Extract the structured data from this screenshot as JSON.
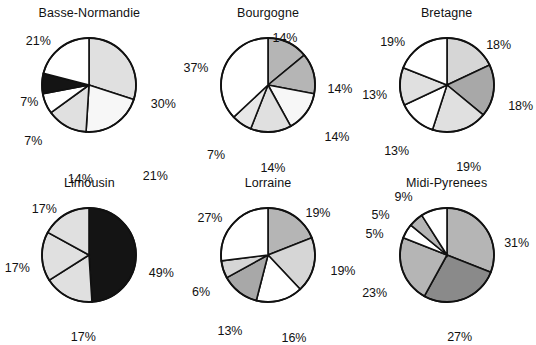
{
  "figure": {
    "background": "#ffffff",
    "rows": 2,
    "cols": 3,
    "label_suffix": "%"
  },
  "palette": {
    "white": "#ffffff",
    "very_light_gray": "#f2f2f2",
    "light_gray": "#e0e0e0",
    "light_gray2": "#d6d6d6",
    "medium_gray": "#b5b5b5",
    "medium_gray2": "#a8a8a8",
    "dark_gray": "#8a8a8a",
    "black": "#141414",
    "outline": "#111111"
  },
  "chart_data": [
    {
      "type": "pie",
      "title": "Basse-Normandie",
      "start_angle": 0,
      "direction": "clockwise",
      "categories": [
        "30%",
        "21%",
        "14%",
        "7%",
        "7%",
        "21%"
      ],
      "values": [
        30,
        21,
        14,
        7,
        7,
        21
      ],
      "labels": [
        "30%",
        "21%",
        "14%",
        "7%",
        "7%",
        "21%"
      ],
      "colors": [
        "#e0e0e0",
        "#f7f7f7",
        "#e0e0e0",
        "#ffffff",
        "#141414",
        "#ffffff"
      ],
      "label_positions": [
        {
          "x": 74,
          "y": 19
        },
        {
          "x": 66,
          "y": 91
        },
        {
          "x": -9,
          "y": 94
        },
        {
          "x": -56,
          "y": 56
        },
        {
          "x": -60,
          "y": 17
        },
        {
          "x": -51,
          "y": -44
        }
      ]
    },
    {
      "type": "pie",
      "title": "Bourgogne",
      "start_angle": 0,
      "direction": "clockwise",
      "categories": [
        "14%",
        "14%",
        "14%",
        "14%",
        "7%",
        "37%"
      ],
      "values": [
        14,
        14,
        14,
        14,
        7,
        37
      ],
      "labels": [
        "14%",
        "14%",
        "14%",
        "14%",
        "7%",
        "37%"
      ],
      "colors": [
        "#b5b5b5",
        "#b5b5b5",
        "#f7f7f7",
        "#e0e0e0",
        "#e8e8e8",
        "#ffffff"
      ],
      "label_positions": [
        {
          "x": 17,
          "y": -47
        },
        {
          "x": 72,
          "y": 4
        },
        {
          "x": 69,
          "y": 52
        },
        {
          "x": 5,
          "y": 83
        },
        {
          "x": -52,
          "y": 70
        },
        {
          "x": -72,
          "y": -17
        }
      ]
    },
    {
      "type": "pie",
      "title": "Bretagne",
      "start_angle": 0,
      "direction": "clockwise",
      "categories": [
        "18%",
        "18%",
        "19%",
        "13%",
        "13%",
        "19%"
      ],
      "values": [
        18,
        18,
        19,
        13,
        13,
        19
      ],
      "labels": [
        "18%",
        "18%",
        "19%",
        "13%",
        "13%",
        "19%"
      ],
      "colors": [
        "#d6d6d6",
        "#a8a8a8",
        "#e0e0e0",
        "#ffffff",
        "#e0e0e0",
        "#ffffff"
      ],
      "label_positions": [
        {
          "x": 52,
          "y": -40
        },
        {
          "x": 74,
          "y": 21
        },
        {
          "x": 22,
          "y": 82
        },
        {
          "x": -50,
          "y": 66
        },
        {
          "x": -72,
          "y": 10
        },
        {
          "x": -54,
          "y": -43
        }
      ]
    },
    {
      "type": "pie",
      "title": "Limousin",
      "start_angle": 0,
      "direction": "clockwise",
      "categories": [
        "49%",
        "17%",
        "17%",
        "17%"
      ],
      "values": [
        49,
        17,
        17,
        17
      ],
      "labels": [
        "49%",
        "17%",
        "17%",
        "17%"
      ],
      "colors": [
        "#141414",
        "#e0e0e0",
        "#e0e0e0",
        "#e0e0e0"
      ],
      "label_positions": [
        {
          "x": 72,
          "y": 18
        },
        {
          "x": -6,
          "y": 82
        },
        {
          "x": -72,
          "y": 13
        },
        {
          "x": -45,
          "y": -46
        }
      ]
    },
    {
      "type": "pie",
      "title": "Lorraine",
      "start_angle": 0,
      "direction": "clockwise",
      "categories": [
        "19%",
        "19%",
        "16%",
        "13%",
        "6%",
        "27%"
      ],
      "values": [
        19,
        19,
        16,
        13,
        6,
        27
      ],
      "labels": [
        "19%",
        "19%",
        "16%",
        "13%",
        "6%",
        "27%"
      ],
      "colors": [
        "#b5b5b5",
        "#d6d6d6",
        "#ffffff",
        "#a8a8a8",
        "#d6d6d6",
        "#ffffff"
      ],
      "label_positions": [
        {
          "x": 50,
          "y": -42
        },
        {
          "x": 75,
          "y": 16
        },
        {
          "x": 26,
          "y": 83
        },
        {
          "x": -38,
          "y": 76
        },
        {
          "x": -67,
          "y": 37
        },
        {
          "x": -58,
          "y": -37
        }
      ]
    },
    {
      "type": "pie",
      "title": "Midi-Pyrenees",
      "start_angle": 0,
      "direction": "clockwise",
      "categories": [
        "31%",
        "27%",
        "23%",
        "5%",
        "5%",
        "9%"
      ],
      "values": [
        31,
        27,
        23,
        5,
        5,
        9
      ],
      "labels": [
        "31%",
        "27%",
        "23%",
        "5%",
        "5%",
        "9%"
      ],
      "colors": [
        "#b5b5b5",
        "#8a8a8a",
        "#b5b5b5",
        "#ffffff",
        "#b5b5b5",
        "#ffffff"
      ],
      "label_positions": [
        {
          "x": 70,
          "y": -12
        },
        {
          "x": 13,
          "y": 82
        },
        {
          "x": -72,
          "y": 38
        },
        {
          "x": -72,
          "y": -21
        },
        {
          "x": -66,
          "y": -40
        },
        {
          "x": -43,
          "y": -58
        }
      ]
    }
  ]
}
